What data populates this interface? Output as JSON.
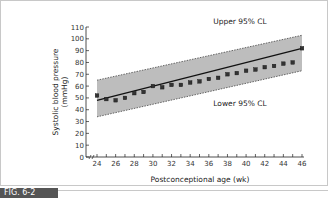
{
  "figure": {
    "caption_label": "FIG. 6-2",
    "frame_color": "#c8c8c8",
    "band_color": "#bdbdbd"
  },
  "chart_data": {
    "type": "scatter",
    "title": "",
    "xlabel": "Postconceptional age (wk)",
    "ylabel": "Systolic blood pressure (mmHg)",
    "ylabel_line1": "Systolic blood pressure",
    "ylabel_line2": "(mmHg)",
    "xlim": [
      23,
      46
    ],
    "ylim": [
      0,
      110
    ],
    "x_ticks": [
      24,
      26,
      28,
      30,
      32,
      34,
      36,
      38,
      40,
      42,
      44,
      46
    ],
    "y_ticks": [
      0,
      10,
      20,
      30,
      40,
      50,
      60,
      70,
      80,
      90,
      100,
      110
    ],
    "axis_break": true,
    "grid": false,
    "annotations": {
      "upper": "Upper 95% CL",
      "lower": "Lower 95% CL"
    },
    "series": [
      {
        "name": "Observed mean SBP",
        "type": "scatter",
        "x": [
          24,
          25,
          26,
          27,
          28,
          29,
          30,
          31,
          32,
          33,
          34,
          35,
          36,
          37,
          38,
          39,
          40,
          41,
          42,
          43,
          44,
          45,
          46
        ],
        "y": [
          52,
          49,
          48,
          50,
          54,
          55,
          60,
          59,
          61,
          61,
          63,
          64,
          66,
          67,
          70,
          71,
          73,
          74,
          76,
          77,
          79,
          80,
          92
        ]
      },
      {
        "name": "Regression line",
        "type": "line",
        "x": [
          24,
          46
        ],
        "y": [
          48,
          92
        ]
      },
      {
        "name": "Upper 95% CL",
        "type": "line",
        "style": "dashed",
        "x": [
          24,
          46
        ],
        "y": [
          65,
          103
        ]
      },
      {
        "name": "Lower 95% CL",
        "type": "line",
        "style": "dashed",
        "x": [
          24,
          46
        ],
        "y": [
          34,
          73
        ]
      }
    ]
  }
}
